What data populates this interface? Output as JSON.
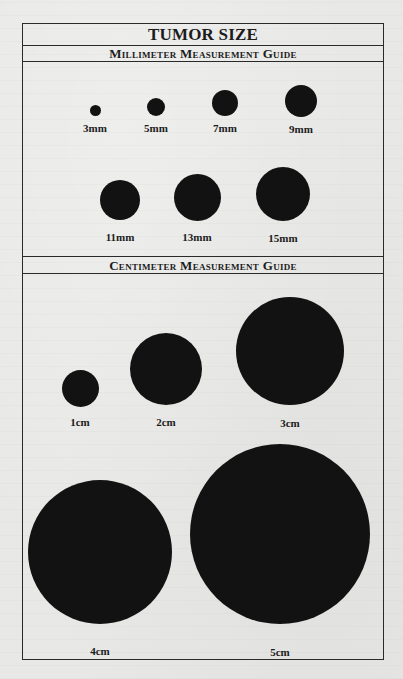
{
  "title": "TUMOR SIZE",
  "sections": {
    "millimeter": {
      "heading": "Millimeter Measurement Guide",
      "items": [
        {
          "label": "3mm",
          "diameter_px": 11,
          "cx": 95,
          "cy": 110,
          "label_y": 122
        },
        {
          "label": "5mm",
          "diameter_px": 18,
          "cx": 156,
          "cy": 107,
          "label_y": 122
        },
        {
          "label": "7mm",
          "diameter_px": 26,
          "cx": 225,
          "cy": 103,
          "label_y": 122
        },
        {
          "label": "9mm",
          "diameter_px": 32,
          "cx": 301,
          "cy": 101,
          "label_y": 123
        },
        {
          "label": "11mm",
          "diameter_px": 40,
          "cx": 120,
          "cy": 200,
          "label_y": 231
        },
        {
          "label": "13mm",
          "diameter_px": 47,
          "cx": 197,
          "cy": 197,
          "label_y": 231
        },
        {
          "label": "15mm",
          "diameter_px": 54,
          "cx": 283,
          "cy": 194,
          "label_y": 232
        }
      ]
    },
    "centimeter": {
      "heading": "Centimeter Measurement Guide",
      "items": [
        {
          "label": "1cm",
          "diameter_px": 37,
          "cx": 80,
          "cy": 388,
          "label_y": 416
        },
        {
          "label": "2cm",
          "diameter_px": 72,
          "cx": 166,
          "cy": 369,
          "label_y": 416
        },
        {
          "label": "3cm",
          "diameter_px": 108,
          "cx": 290,
          "cy": 351,
          "label_y": 417
        },
        {
          "label": "4cm",
          "diameter_px": 144,
          "cx": 100,
          "cy": 552,
          "label_y": 645
        },
        {
          "label": "5cm",
          "diameter_px": 180,
          "cx": 280,
          "cy": 534,
          "label_y": 646
        }
      ]
    }
  },
  "colors": {
    "paper": "#e8e8e6",
    "ink": "#121212",
    "rule": "#2a2a2a"
  }
}
